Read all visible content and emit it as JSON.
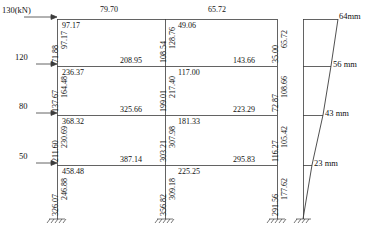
{
  "figure": {
    "type": "structural-frame-analysis-diagram",
    "units_note": "130(kN)",
    "load_unit": "kN",
    "deflection_unit": "mm"
  },
  "lateral_loads": [
    {
      "value": "130(kN)",
      "level": 4
    },
    {
      "value": "120",
      "level": 3
    },
    {
      "value": "80",
      "level": 2
    },
    {
      "value": "50",
      "level": 1
    }
  ],
  "span_labels": [
    {
      "value": "79.70"
    },
    {
      "value": "65.72"
    }
  ],
  "beam_moments": {
    "story4": {
      "left_bay_left": "97.17",
      "left_bay_right": "208.95",
      "right_bay_left": "49.06",
      "right_bay_right": "143.66"
    },
    "story3": {
      "left_bay_left": "236.37",
      "left_bay_right": "325.66",
      "right_bay_left": "117.00",
      "right_bay_right": "223.29"
    },
    "story2": {
      "left_bay_left": "368.32",
      "left_bay_right": "387.14",
      "right_bay_left": "181.33",
      "right_bay_right": "295.83"
    },
    "story1": {
      "left_bay_left": "458.48",
      "right_bay_left": "225.25"
    }
  },
  "column_moments": {
    "left_column": {
      "story4_top": "97.17",
      "story4_bottom": "71.88",
      "story3_top": "164.48",
      "story3_bottom": "137.67",
      "story2_top": "230.69",
      "story2_bottom": "211.60",
      "story1_top": "246.88",
      "story1_bottom": "326.07"
    },
    "middle_column": {
      "story4_top": "128.76",
      "story4_bottom": "108.54",
      "story3_top": "217.40",
      "story3_bottom": "199.01",
      "story2_top": "307.98",
      "story2_bottom": "303.21",
      "story1_top": "309.18",
      "story1_bottom": "356.82"
    },
    "right_column": {
      "story4_top": "65.72",
      "story4_bottom": "35.00",
      "story3_top": "108.66",
      "story3_bottom": "72.87",
      "story2_top": "105.42",
      "story2_bottom": "116.27",
      "story1_top": "177.62",
      "story1_bottom": "291.56"
    }
  },
  "deflections": [
    {
      "label": "64mm",
      "level": 4
    },
    {
      "label": "56 mm",
      "level": 3
    },
    {
      "label": "43 mm",
      "level": 2
    },
    {
      "label": "23 mm",
      "level": 1
    }
  ],
  "colors": {
    "line": "#3c3c3c",
    "text": "#111111",
    "background": "#ffffff"
  }
}
